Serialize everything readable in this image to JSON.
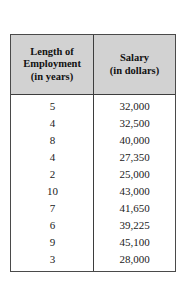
{
  "table": {
    "columns": [
      {
        "id": "length-of-employment",
        "lines": [
          "Length of",
          "Employment",
          "(in years)"
        ]
      },
      {
        "id": "salary",
        "lines": [
          "Salary",
          "(in dollars)"
        ]
      }
    ],
    "rows": [
      {
        "length": "5",
        "salary": "32,000"
      },
      {
        "length": "4",
        "salary": "32,500"
      },
      {
        "length": "8",
        "salary": "40,000"
      },
      {
        "length": "4",
        "salary": "27,350"
      },
      {
        "length": "2",
        "salary": "25,000"
      },
      {
        "length": "10",
        "salary": "43,000"
      },
      {
        "length": "7",
        "salary": "41,650"
      },
      {
        "length": "6",
        "salary": "39,225"
      },
      {
        "length": "9",
        "salary": "45,100"
      },
      {
        "length": "3",
        "salary": "28,000"
      }
    ]
  },
  "chart_data": {
    "type": "table",
    "title": "",
    "columns": [
      "Length of Employment (in years)",
      "Salary (in dollars)"
    ],
    "xlabel": "Length of Employment (in years)",
    "ylabel": "Salary (in dollars)",
    "x": [
      5,
      4,
      8,
      4,
      2,
      10,
      7,
      6,
      9,
      3
    ],
    "values": [
      32000,
      32500,
      40000,
      27350,
      25000,
      43000,
      41650,
      39225,
      45100,
      28000
    ],
    "rows": [
      [
        5,
        32000
      ],
      [
        4,
        32500
      ],
      [
        8,
        40000
      ],
      [
        4,
        27350
      ],
      [
        2,
        25000
      ],
      [
        10,
        43000
      ],
      [
        7,
        41650
      ],
      [
        6,
        39225
      ],
      [
        9,
        45100
      ],
      [
        3,
        28000
      ]
    ],
    "n": 10,
    "grid": false,
    "legend": "none"
  },
  "colors": {
    "header_fill": "#d2d2d2",
    "border": "#3d3d3d",
    "text": "#1a1a1a",
    "background": "#ffffff"
  }
}
